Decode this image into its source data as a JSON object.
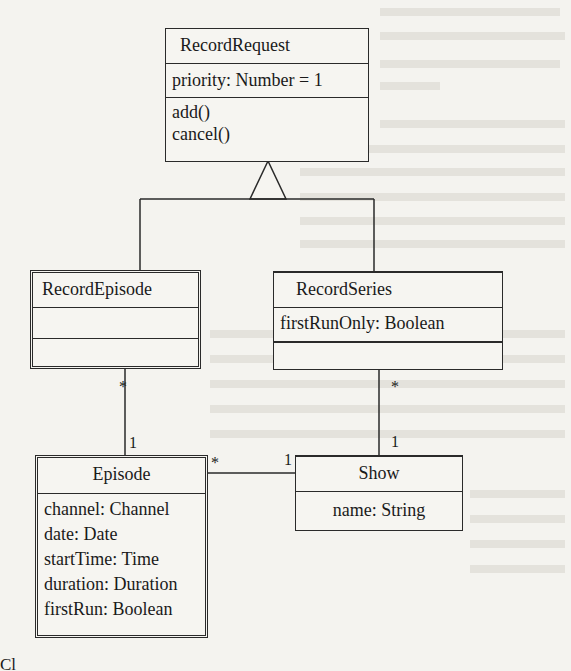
{
  "diagram": {
    "classes": {
      "record_request": {
        "name": "RecordRequest",
        "attributes": [
          "priority: Number = 1"
        ],
        "operations": [
          "add()",
          "cancel()"
        ]
      },
      "record_episode": {
        "name": "RecordEpisode",
        "attributes": [],
        "operations": []
      },
      "record_series": {
        "name": "RecordSeries",
        "attributes": [
          "firstRunOnly: Boolean"
        ],
        "operations": []
      },
      "episode": {
        "name": "Episode",
        "attributes": [
          "channel: Channel",
          "date: Date",
          "startTime: Time",
          "duration: Duration",
          "firstRun: Boolean"
        ]
      },
      "show": {
        "name": "Show",
        "attributes": [
          "name: String"
        ]
      }
    },
    "relationships": {
      "generalization": {
        "parent": "RecordRequest",
        "children": [
          "RecordEpisode",
          "RecordSeries"
        ]
      },
      "record_episode_to_episode": {
        "source_mult": "*",
        "target_mult": "1"
      },
      "record_series_to_show": {
        "source_mult": "*",
        "target_mult": "1"
      },
      "episode_to_show": {
        "source_mult": "*",
        "target_mult": "1"
      }
    },
    "caption": "Cl"
  }
}
